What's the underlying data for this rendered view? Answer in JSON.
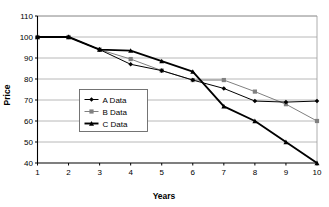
{
  "chart_data": {
    "type": "line",
    "title": "",
    "xlabel": "Years",
    "ylabel": "Price",
    "xlim": [
      1,
      10
    ],
    "ylim": [
      40,
      110
    ],
    "ytick_interval": 10,
    "grid": true,
    "grid_axis": "y",
    "legend_position": "center-left-inside",
    "x": [
      1,
      2,
      3,
      4,
      5,
      6,
      7,
      8,
      9,
      10
    ],
    "xticklabels": [
      "1",
      "2",
      "3",
      "4",
      "5",
      "6",
      "7",
      "8",
      "9",
      "10"
    ],
    "yticklabels": [
      "40",
      "50",
      "60",
      "70",
      "80",
      "90",
      "100",
      "110"
    ],
    "yticks": [
      40,
      50,
      60,
      70,
      80,
      90,
      100,
      110
    ],
    "series": [
      {
        "name": "A Data",
        "marker": "diamond",
        "color": "#000000",
        "line_width": "thin",
        "values": [
          100,
          100,
          94,
          87,
          84,
          79.5,
          75.5,
          69.5,
          69,
          69.5
        ]
      },
      {
        "name": "B Data",
        "marker": "square",
        "color": "#808080",
        "line_width": "thin",
        "values": [
          100,
          100,
          94,
          89.5,
          84,
          79.5,
          79.5,
          74,
          68,
          60
        ]
      },
      {
        "name": "C Data",
        "marker": "triangle",
        "color": "#000000",
        "line_width": "thick",
        "values": [
          100,
          100,
          94,
          93.5,
          88.5,
          83.5,
          67,
          60,
          50,
          40
        ]
      }
    ]
  },
  "legend": {
    "items": [
      {
        "label": "A Data",
        "marker": "diamond"
      },
      {
        "label": "B Data",
        "marker": "square"
      },
      {
        "label": "C Data",
        "marker": "triangle"
      }
    ]
  },
  "colors": {
    "axis": "#000000",
    "grid": "#a6a6a6",
    "plot_border": "#9a9a9a",
    "series_a": "#000000",
    "series_b": "#808080",
    "series_c": "#000000",
    "background": "#ffffff"
  }
}
